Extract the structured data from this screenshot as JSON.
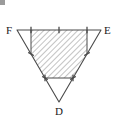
{
  "figure": {
    "canvas": {
      "width": 117,
      "height": 121
    },
    "background_color": "#ffffff",
    "stroke_color": "#4a4a4a",
    "hatch_color": "#7a7a7a",
    "label_color": "#1a1a1a",
    "labels": {
      "F": "F",
      "E": "E",
      "D": "D"
    },
    "vertices": {
      "F": {
        "x": 17,
        "y": 30
      },
      "E": {
        "x": 101,
        "y": 30
      },
      "D": {
        "x": 59,
        "y": 102
      }
    },
    "trisection_points": {
      "FE_1": {
        "x": 45,
        "y": 30
      },
      "FE_2": {
        "x": 73,
        "y": 30
      },
      "FD_1": {
        "x": 31,
        "y": 54
      },
      "FD_2": {
        "x": 45,
        "y": 78
      },
      "ED_1": {
        "x": 87,
        "y": 54
      },
      "ED_2": {
        "x": 73,
        "y": 78
      }
    },
    "shaded_polygon": [
      {
        "x": 31,
        "y": 30
      },
      {
        "x": 87,
        "y": 30
      },
      {
        "x": 87,
        "y": 54
      },
      {
        "x": 73,
        "y": 78
      },
      {
        "x": 45,
        "y": 78
      },
      {
        "x": 31,
        "y": 54
      }
    ],
    "inner_segments": [
      {
        "name": "left-corner-cut",
        "from": {
          "x": 31,
          "y": 30
        },
        "to": {
          "x": 31,
          "y": 54
        }
      },
      {
        "name": "right-corner-cut",
        "from": {
          "x": 87,
          "y": 30
        },
        "to": {
          "x": 87,
          "y": 54
        }
      },
      {
        "name": "bottom-cut",
        "from": {
          "x": 45,
          "y": 78
        },
        "to": {
          "x": 73,
          "y": 78
        }
      }
    ],
    "tick_marks": [
      {
        "name": "tick-FE-a",
        "x": 31,
        "y": 30,
        "angle": 90
      },
      {
        "name": "tick-FE-b",
        "x": 59,
        "y": 30,
        "angle": 90
      },
      {
        "name": "tick-FE-c",
        "x": 87,
        "y": 30,
        "angle": 90
      },
      {
        "name": "tick-FD-a",
        "x": 31,
        "y": 54,
        "angle": 30
      },
      {
        "name": "tick-FD-b",
        "x": 45,
        "y": 78,
        "angle": 30
      },
      {
        "name": "tick-ED-a",
        "x": 87,
        "y": 54,
        "angle": 150
      },
      {
        "name": "tick-ED-b",
        "x": 73,
        "y": 78,
        "angle": 150
      },
      {
        "name": "tick-bottom-a",
        "x": 45,
        "y": 78,
        "angle": 90
      },
      {
        "name": "tick-bottom-b",
        "x": 73,
        "y": 78,
        "angle": 90
      }
    ],
    "hatch": {
      "angle_degrees": 45,
      "spacing_px": 4,
      "line_width": 0.8
    }
  }
}
